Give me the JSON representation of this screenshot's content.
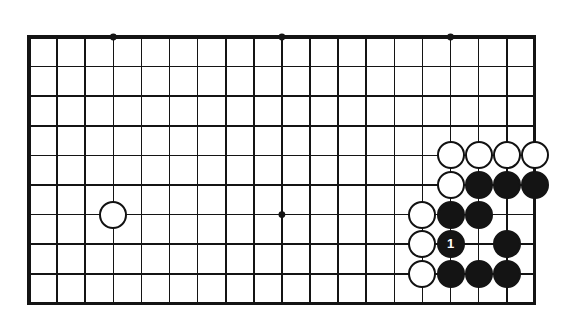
{
  "figure": {
    "kind": "go-board-diagram",
    "line_color": "#141414",
    "board_color": "#ffffff",
    "black_stone_color": "#141414",
    "white_stone_color": "#ffffff"
  },
  "board": {
    "columns": 19,
    "rows_shown": 10,
    "origin_x": 29,
    "origin_y": 37,
    "col_spacing": 28.1,
    "row_spacing": 29.6,
    "edge_top": true,
    "edge_right": true,
    "edge_left_thick": true,
    "edge_bottom_thick": true,
    "border_width": 3.2,
    "line_width": 1.6,
    "stone_diameter": 28
  },
  "star_points": [
    {
      "col": 3,
      "row": 0,
      "name": "hoshi-left-top"
    },
    {
      "col": 9,
      "row": 0,
      "name": "hoshi-center-top"
    },
    {
      "col": 15,
      "row": 0,
      "name": "hoshi-right-top"
    },
    {
      "col": 9,
      "row": 6,
      "name": "hoshi-center-middle"
    }
  ],
  "stones": [
    {
      "col": 3,
      "row": 6,
      "color": "white",
      "label": "",
      "name": "white-stone-left-side"
    },
    {
      "col": 15,
      "row": 4,
      "color": "white",
      "label": "",
      "name": "white-stone-c15-r4"
    },
    {
      "col": 16,
      "row": 4,
      "color": "white",
      "label": "",
      "name": "white-stone-c16-r4"
    },
    {
      "col": 17,
      "row": 4,
      "color": "white",
      "label": "",
      "name": "white-stone-c17-r4"
    },
    {
      "col": 18,
      "row": 4,
      "color": "white",
      "label": "",
      "name": "white-stone-c18-r4"
    },
    {
      "col": 15,
      "row": 5,
      "color": "white",
      "label": "",
      "name": "white-stone-c15-r5"
    },
    {
      "col": 16,
      "row": 5,
      "color": "black",
      "label": "",
      "name": "black-stone-c16-r5"
    },
    {
      "col": 17,
      "row": 5,
      "color": "black",
      "label": "",
      "name": "black-stone-c17-r5"
    },
    {
      "col": 18,
      "row": 5,
      "color": "black",
      "label": "",
      "name": "black-stone-c18-r5"
    },
    {
      "col": 14,
      "row": 6,
      "color": "white",
      "label": "",
      "name": "white-stone-c14-r6"
    },
    {
      "col": 15,
      "row": 6,
      "color": "black",
      "label": "",
      "name": "black-stone-c15-r6"
    },
    {
      "col": 16,
      "row": 6,
      "color": "black",
      "label": "",
      "name": "black-stone-c16-r6"
    },
    {
      "col": 14,
      "row": 7,
      "color": "white",
      "label": "",
      "name": "white-stone-c14-r7"
    },
    {
      "col": 15,
      "row": 7,
      "color": "black",
      "label": "1",
      "name": "black-stone-move-1"
    },
    {
      "col": 17,
      "row": 7,
      "color": "black",
      "label": "",
      "name": "black-stone-c17-r7"
    },
    {
      "col": 14,
      "row": 8,
      "color": "white",
      "label": "",
      "name": "white-stone-c14-r8"
    },
    {
      "col": 15,
      "row": 8,
      "color": "black",
      "label": "",
      "name": "black-stone-c15-r8"
    },
    {
      "col": 16,
      "row": 8,
      "color": "black",
      "label": "",
      "name": "black-stone-c16-r8"
    },
    {
      "col": 17,
      "row": 8,
      "color": "black",
      "label": "",
      "name": "black-stone-c17-r8"
    }
  ],
  "move_numbers": {
    "visible": [
      "1"
    ]
  }
}
